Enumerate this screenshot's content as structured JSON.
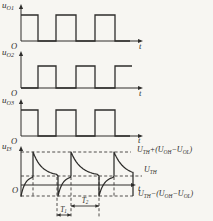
{
  "colors": {
    "ink": "#2e2d2b",
    "paper": "#f7f6f2",
    "dash": "#3c3b39"
  },
  "panels": [
    {
      "id": "uO1",
      "ylabel": [
        {
          "t": "u"
        },
        {
          "t": "O1",
          "sub": true
        }
      ],
      "origin_label": "O",
      "t_label": "t",
      "wave": {
        "type": "square",
        "x0": 21,
        "axis_y": 41,
        "high_y": 15,
        "y_top": 4,
        "start": "high",
        "toggles": [
          38,
          56,
          76,
          95,
          115
        ],
        "end_x": 130,
        "axis_end": 143
      }
    },
    {
      "id": "uO2",
      "ylabel": [
        {
          "t": "u"
        },
        {
          "t": "O2",
          "sub": true
        }
      ],
      "origin_label": "O",
      "t_label": "t",
      "wave": {
        "type": "square",
        "x0": 21,
        "axis_y": 88,
        "high_y": 66,
        "y_top": 51,
        "start": "low",
        "toggles": [
          38,
          56,
          76,
          95,
          115
        ],
        "end_x": 132,
        "axis_end": 143
      }
    },
    {
      "id": "uO3",
      "ylabel": [
        {
          "t": "u"
        },
        {
          "t": "O3",
          "sub": true
        }
      ],
      "origin_label": "O",
      "t_label": "t",
      "wave": {
        "type": "square",
        "x0": 21,
        "axis_y": 136,
        "high_y": 110,
        "y_top": 99,
        "start": "high",
        "toggles": [
          38,
          56,
          76,
          95,
          115
        ],
        "end_x": 130,
        "axis_end": 143
      }
    },
    {
      "id": "uI3",
      "ylabel": [
        {
          "t": "u"
        },
        {
          "t": "I3",
          "sub": true
        }
      ],
      "origin_label": "O",
      "t_label": "t",
      "wave": {
        "type": "exp",
        "x0": 21,
        "axis_y": 185,
        "y_top": 146,
        "y_axis_bottom": 197,
        "axis_end": 136,
        "levels": {
          "top": 152,
          "mid": 176,
          "bottom": 196
        },
        "segments": [
          [
            "rise",
            21,
            33
          ],
          [
            "jump",
            33,
            "top"
          ],
          [
            "decay",
            33,
            58
          ],
          [
            "jump",
            58,
            "bottom"
          ],
          [
            "rise",
            58,
            71
          ],
          [
            "jump",
            71,
            "top"
          ],
          [
            "decay",
            71,
            99
          ],
          [
            "jump",
            99,
            "bottom"
          ],
          [
            "rise",
            99,
            114
          ],
          [
            "jump",
            114,
            "top"
          ],
          [
            "decaycut",
            114,
            133,
            28
          ],
          [
            "jump",
            133,
            "bottom"
          ]
        ],
        "dashed_h": [
          [
            152,
            21,
            131
          ],
          [
            176,
            21,
            142
          ],
          [
            196,
            21,
            133
          ]
        ],
        "dashed_v": [
          [
            33,
            177,
            196
          ],
          [
            57,
            177,
            217
          ],
          [
            71,
            177,
            217
          ],
          [
            99,
            177,
            217
          ],
          [
            114,
            177,
            196
          ]
        ]
      },
      "annotations": {
        "level_top": [
          {
            "t": "U"
          },
          {
            "t": "TH",
            "sub": true
          },
          {
            "t": "+("
          },
          {
            "t": "U"
          },
          {
            "t": "OH",
            "sub": true
          },
          {
            "t": "−"
          },
          {
            "t": "U"
          },
          {
            "t": "OL",
            "sub": true
          },
          {
            "t": ")"
          }
        ],
        "level_mid": [
          {
            "t": "U"
          },
          {
            "t": "TH",
            "sub": true
          }
        ],
        "level_bottom": [
          {
            "t": "U"
          },
          {
            "t": "TH",
            "sub": true
          },
          {
            "t": "−("
          },
          {
            "t": "U"
          },
          {
            "t": "OH",
            "sub": true
          },
          {
            "t": "−"
          },
          {
            "t": "U"
          },
          {
            "t": "OL",
            "sub": true
          },
          {
            "t": ")"
          }
        ],
        "t1": [
          {
            "t": "T"
          },
          {
            "t": "1",
            "sub": true
          }
        ],
        "t2": [
          {
            "t": "T"
          },
          {
            "t": "2",
            "sub": true
          }
        ],
        "t1_span": [
          57,
          71,
          215
        ],
        "t2_span": [
          71,
          99,
          206
        ]
      }
    }
  ]
}
